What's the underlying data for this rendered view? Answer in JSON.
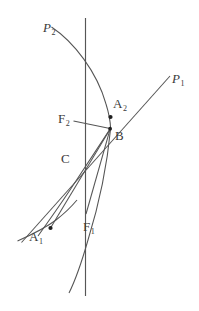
{
  "figure": {
    "type": "geometry-diagram",
    "background_color": "#ffffff",
    "stroke_color": "#4a4a4a",
    "label_color": "#3a3a3a",
    "point_color": "#1a1a1a"
  },
  "labels": {
    "p2": {
      "text": "P",
      "sub": "2",
      "style": "italic",
      "x": 43,
      "y": 21
    },
    "p1": {
      "text": "P",
      "sub": "1",
      "style": "italic",
      "x": 172,
      "y": 72
    },
    "a2": {
      "text": "A",
      "sub": "2",
      "style": "upright",
      "x": 113,
      "y": 97
    },
    "f2": {
      "text": "F",
      "sub": "2",
      "style": "upright",
      "x": 58,
      "y": 112
    },
    "b": {
      "text": "B",
      "sub": "",
      "style": "upright",
      "x": 115,
      "y": 129
    },
    "c": {
      "text": "C",
      "sub": "",
      "style": "upright",
      "x": 61,
      "y": 152
    },
    "a1": {
      "text": "A",
      "sub": "1",
      "style": "upright",
      "x": 29,
      "y": 230
    },
    "f1": {
      "text": "F",
      "sub": "1",
      "style": "upright",
      "x": 83,
      "y": 220
    }
  },
  "points": [
    {
      "name": "A2",
      "x": 110.5,
      "y": 117.0,
      "r": 2.1
    },
    {
      "name": "B",
      "x": 110.0,
      "y": 128.5,
      "r": 1.9
    },
    {
      "name": "A1",
      "x": 50.5,
      "y": 228.0,
      "r": 2.1
    }
  ],
  "vertical_line": {
    "x": 85.5,
    "y_top": 18,
    "y_bottom": 296
  },
  "segments": [
    {
      "name": "F2-B",
      "x1": 74.0,
      "y1": 121.5,
      "x2": 110.0,
      "y2": 128.5
    },
    {
      "name": "F1-B",
      "x1": 86.0,
      "y1": 214.0,
      "x2": 110.0,
      "y2": 128.5
    },
    {
      "name": "A1-B",
      "x1": 50.5,
      "y1": 228.0,
      "x2": 110.0,
      "y2": 128.5
    }
  ],
  "rays": [
    {
      "name": "P1-ray",
      "x1": 22.0,
      "y1": 242.0,
      "x2": 170.0,
      "y2": 76.0
    }
  ],
  "curves": [
    {
      "name": "P2-arc-upper",
      "d": "M 51.5 27.0 C 78 45 101 76 110 128.5"
    },
    {
      "name": "B-lower-arc",
      "d": "M 110.0 128.5 C 104 168 92 230 69 292"
    },
    {
      "name": "A1-through-C-arc",
      "d": "M 110.0 128.5 C 95 150 72 186 40 224"
    },
    {
      "name": "lower-left-arc",
      "d": "M 17.5 240.0 C 35 232 52 222 72 202"
    }
  ]
}
